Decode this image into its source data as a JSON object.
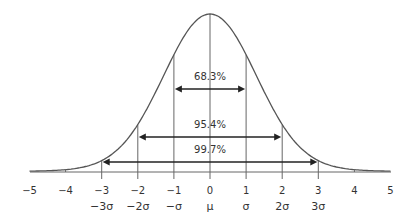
{
  "chart_data": {
    "type": "line",
    "title": "",
    "xlabel": "",
    "ylabel": "",
    "xlim": [
      -5,
      5
    ],
    "grid": false,
    "legend": null,
    "series": [
      {
        "name": "normal-distribution-curve",
        "x": [
          -5,
          -4,
          -3,
          -2,
          -1,
          0,
          1,
          2,
          3,
          4,
          5
        ],
        "values": [
          0.0,
          0.04,
          0.11,
          0.25,
          0.75,
          1.0,
          0.75,
          0.25,
          0.11,
          0.04,
          0.0
        ]
      }
    ],
    "x_ticks": [
      "−5",
      "−4",
      "−3",
      "−2",
      "−1",
      "0",
      "1",
      "2",
      "3",
      "4",
      "5"
    ],
    "sigma_ticks": [
      {
        "x": -3,
        "label": "−3σ"
      },
      {
        "x": -2,
        "label": "−2σ"
      },
      {
        "x": -1,
        "label": "−σ"
      },
      {
        "x": 0,
        "label": "μ"
      },
      {
        "x": 1,
        "label": "σ"
      },
      {
        "x": 2,
        "label": "2σ"
      },
      {
        "x": 3,
        "label": "3σ"
      }
    ],
    "annotations": [
      {
        "label": "68.3%",
        "from": -1,
        "to": 1
      },
      {
        "label": "95.4%",
        "from": -2,
        "to": 2
      },
      {
        "label": "99.7%",
        "from": -3,
        "to": 3
      }
    ],
    "colors": {
      "curve": "#555555",
      "lines": "#666666",
      "arrows": "#222222",
      "text": "#333333"
    }
  }
}
